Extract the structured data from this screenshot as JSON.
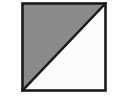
{
  "figure": {
    "title": "Square divided by a diagonal with one half shaded",
    "shape": "square",
    "background_color": "#ffffff",
    "canvas": {
      "width": 124,
      "height": 103
    },
    "square": {
      "x": 22.5,
      "y": 3.5,
      "width": 83,
      "height": 87,
      "border_color": "#1a1a1a",
      "border_width": 2.6
    },
    "diagonal": {
      "description": "line from top-right corner to bottom-left corner",
      "from_corner": "top-right",
      "to_corner": "bottom-left",
      "x1": 105.5,
      "y1": 3.5,
      "x2": 22.5,
      "y2": 90.5,
      "color": "#1a1a1a",
      "width": 2.4
    },
    "regions": [
      {
        "name": "upper-left-triangle",
        "state": "shaded",
        "fill_color": "#8a8a8a",
        "points": "22.5,3.5 105.5,3.5 22.5,90.5",
        "fraction": "1/2"
      },
      {
        "name": "lower-right-triangle",
        "state": "unshaded",
        "fill_color": "#fbfbfb",
        "points": "105.5,3.5 105.5,90.5 22.5,90.5",
        "fraction": "1/2"
      }
    ]
  }
}
